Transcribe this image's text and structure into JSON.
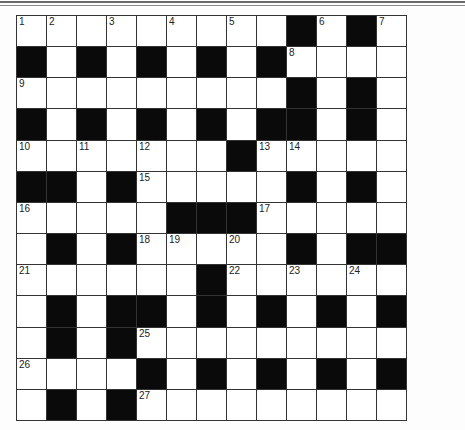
{
  "puzzle": {
    "type": "crossword",
    "rows": 13,
    "cols": 13,
    "colors": {
      "block": "#0a0a0a",
      "cell": "#ffffff",
      "grid_line": "#333333"
    },
    "layout": [
      "WWWWWWWWWBWBW",
      "BWBWBWBWBWWWW",
      "WWWWWWWWWBWBW",
      "BWBWBWBWBBWBW",
      "WWWWWWWBWWWWW",
      "BBWBWWWWWBWBW",
      "WWWWWBBBWWWWW",
      "WBWBWWWWWBWBB",
      "WWWWWWBWWWWWW",
      "WBWBBWBWBWBWB",
      "WBWBWWWWWWWWW",
      "WWWWBWBWBWBWB",
      "WBWBWWWWWWWWW"
    ],
    "numbers": [
      {
        "row": 0,
        "col": 0,
        "n": "1"
      },
      {
        "row": 0,
        "col": 1,
        "n": "2"
      },
      {
        "row": 0,
        "col": 3,
        "n": "3"
      },
      {
        "row": 0,
        "col": 5,
        "n": "4"
      },
      {
        "row": 0,
        "col": 7,
        "n": "5"
      },
      {
        "row": 0,
        "col": 10,
        "n": "6"
      },
      {
        "row": 0,
        "col": 12,
        "n": "7"
      },
      {
        "row": 1,
        "col": 9,
        "n": "8"
      },
      {
        "row": 2,
        "col": 0,
        "n": "9"
      },
      {
        "row": 4,
        "col": 0,
        "n": "10"
      },
      {
        "row": 4,
        "col": 2,
        "n": "11"
      },
      {
        "row": 4,
        "col": 4,
        "n": "12"
      },
      {
        "row": 4,
        "col": 8,
        "n": "13"
      },
      {
        "row": 4,
        "col": 9,
        "n": "14"
      },
      {
        "row": 5,
        "col": 4,
        "n": "15"
      },
      {
        "row": 6,
        "col": 0,
        "n": "16"
      },
      {
        "row": 6,
        "col": 8,
        "n": "17"
      },
      {
        "row": 7,
        "col": 4,
        "n": "18"
      },
      {
        "row": 7,
        "col": 5,
        "n": "19"
      },
      {
        "row": 7,
        "col": 7,
        "n": "20"
      },
      {
        "row": 8,
        "col": 0,
        "n": "21"
      },
      {
        "row": 8,
        "col": 7,
        "n": "22"
      },
      {
        "row": 8,
        "col": 9,
        "n": "23"
      },
      {
        "row": 8,
        "col": 11,
        "n": "24"
      },
      {
        "row": 10,
        "col": 4,
        "n": "25"
      },
      {
        "row": 11,
        "col": 0,
        "n": "26"
      },
      {
        "row": 12,
        "col": 4,
        "n": "27"
      }
    ]
  }
}
